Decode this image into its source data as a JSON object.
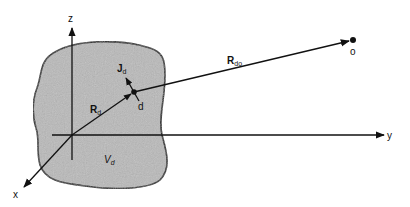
{
  "diagram": {
    "type": "vector-geometry",
    "axes": {
      "z_label": "z",
      "y_label": "y",
      "x_label": "x"
    },
    "region": {
      "label_main": "V",
      "label_sub": "d",
      "fill_color": "#b9b9b9",
      "stroke_color": "#1a1a1a"
    },
    "vectors": {
      "r_d": {
        "label_main": "R",
        "label_sub": "d"
      },
      "r_do": {
        "label_main": "R",
        "label_sub": "do"
      },
      "j_d": {
        "label_main": "J",
        "label_sub": "d"
      }
    },
    "points": {
      "source_label": "d",
      "observation_label": "o"
    }
  }
}
